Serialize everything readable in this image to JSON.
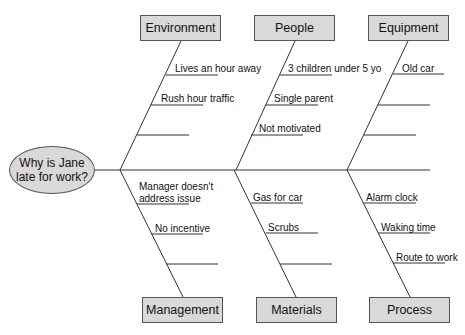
{
  "problem": {
    "line1": "Why is Jane",
    "line2": "late for work?"
  },
  "categories": {
    "environment": {
      "label": "Environment",
      "causes": [
        "Lives an hour away",
        "Rush hour traffic",
        ""
      ]
    },
    "people": {
      "label": "People",
      "causes": [
        "3 children under 5 yo",
        "Single parent",
        "Not motivated"
      ]
    },
    "equipment": {
      "label": "Equipment",
      "causes": [
        "Old car",
        "",
        "",
        ""
      ]
    },
    "management": {
      "label": "Management",
      "causes": [
        "Manager doesn't address issue",
        "No incentive",
        ""
      ],
      "cause0_line1": "Manager doesn't",
      "cause0_line2": "address issue"
    },
    "materials": {
      "label": "Materials",
      "causes": [
        "Gas for car",
        "Scrubs",
        ""
      ]
    },
    "process": {
      "label": "Process",
      "causes": [
        "Alarm clock",
        "Waking time",
        "Route to work"
      ]
    }
  },
  "colors": {
    "box_fill": "#d9d9d9",
    "line": "#333333",
    "background": "#ffffff"
  }
}
